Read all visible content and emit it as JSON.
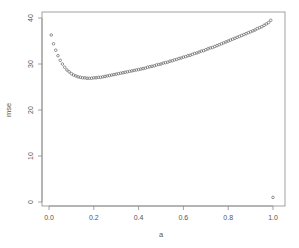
{
  "chart_data": {
    "type": "scatter",
    "title": "",
    "xlabel": "a",
    "ylabel": "mse",
    "xlim": [
      -0.04,
      1.04
    ],
    "ylim": [
      -0.6,
      41.6
    ],
    "grid": false,
    "legend": null,
    "x_ticks": [
      0.0,
      0.2,
      0.4,
      0.6,
      0.8,
      1.0
    ],
    "x_tick_labels": [
      "0.0",
      "0.2",
      "0.4",
      "0.6",
      "0.8",
      "1.0"
    ],
    "y_ticks": [
      0,
      10,
      20,
      30,
      40
    ],
    "y_tick_labels": [
      "0",
      "10",
      "20",
      "30",
      "40"
    ],
    "marker": "open-circle",
    "marker_color": "#666666",
    "series": [
      {
        "name": "mse",
        "x": [
          0.01,
          0.02,
          0.03,
          0.04,
          0.05,
          0.06,
          0.07,
          0.08,
          0.09,
          0.1,
          0.11,
          0.12,
          0.13,
          0.14,
          0.15,
          0.16,
          0.17,
          0.18,
          0.19,
          0.2,
          0.21,
          0.22,
          0.23,
          0.24,
          0.25,
          0.26,
          0.27,
          0.28,
          0.29,
          0.3,
          0.31,
          0.32,
          0.33,
          0.34,
          0.35,
          0.36,
          0.37,
          0.38,
          0.39,
          0.4,
          0.41,
          0.42,
          0.43,
          0.44,
          0.45,
          0.46,
          0.47,
          0.48,
          0.49,
          0.5,
          0.51,
          0.52,
          0.53,
          0.54,
          0.55,
          0.56,
          0.57,
          0.58,
          0.59,
          0.6,
          0.61,
          0.62,
          0.63,
          0.64,
          0.65,
          0.66,
          0.67,
          0.68,
          0.69,
          0.7,
          0.71,
          0.72,
          0.73,
          0.74,
          0.75,
          0.76,
          0.77,
          0.78,
          0.79,
          0.8,
          0.81,
          0.82,
          0.83,
          0.84,
          0.85,
          0.86,
          0.87,
          0.88,
          0.89,
          0.9,
          0.91,
          0.92,
          0.93,
          0.94,
          0.95,
          0.96,
          0.97,
          0.98,
          0.99,
          1.0
        ],
        "y": [
          36.3,
          34.4,
          33.0,
          31.8,
          30.8,
          30.0,
          29.3,
          28.7,
          28.3,
          27.9,
          27.6,
          27.4,
          27.2,
          27.1,
          27.0,
          27.0,
          26.9,
          26.9,
          26.9,
          27.0,
          27.0,
          27.1,
          27.1,
          27.2,
          27.3,
          27.4,
          27.5,
          27.6,
          27.7,
          27.8,
          27.9,
          28.0,
          28.1,
          28.2,
          28.3,
          28.4,
          28.5,
          28.6,
          28.7,
          28.8,
          28.9,
          29.0,
          29.1,
          29.3,
          29.4,
          29.5,
          29.6,
          29.8,
          29.9,
          30.0,
          30.2,
          30.3,
          30.4,
          30.6,
          30.7,
          30.9,
          31.0,
          31.2,
          31.3,
          31.5,
          31.6,
          31.8,
          31.9,
          32.1,
          32.3,
          32.4,
          32.6,
          32.8,
          32.9,
          33.1,
          33.3,
          33.5,
          33.6,
          33.8,
          34.0,
          34.2,
          34.4,
          34.6,
          34.8,
          35.0,
          35.2,
          35.4,
          35.6,
          35.8,
          36.0,
          36.2,
          36.4,
          36.6,
          36.8,
          37.0,
          37.2,
          37.4,
          37.7,
          37.9,
          38.1,
          38.4,
          38.7,
          39.0,
          39.5,
          1.0
        ]
      }
    ]
  },
  "axes": {
    "x_title": "a",
    "y_title": "mse"
  }
}
